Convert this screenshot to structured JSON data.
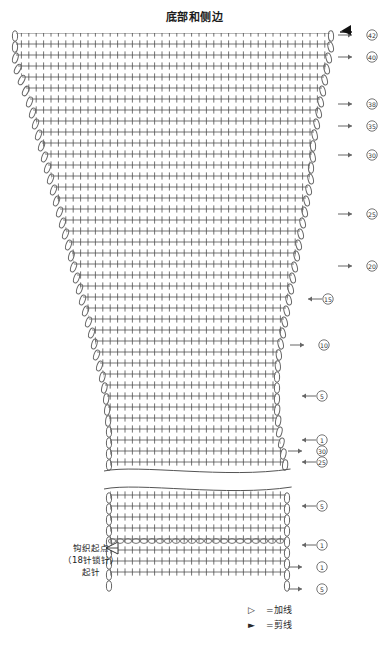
{
  "page": {
    "title": "底部和侧边",
    "background": "#ffffff",
    "stitch_color": "#4a4a4a",
    "marker_color": "#666666",
    "width": 389,
    "height": 661
  },
  "chart_data": {
    "type": "table",
    "title": "底部和侧边",
    "xlabel": "",
    "ylabel": "",
    "stitch_symbol": "+",
    "stitch_name": "短针",
    "edge_symbol": "oval-chain",
    "categories": [],
    "values": [],
    "grid": {
      "rows": 48,
      "top_columns": 46,
      "widest_columns": 46,
      "bottom_columns": 26,
      "row_height": 11,
      "col_width": 7.4,
      "chart_left": 14,
      "chart_right": 330,
      "chart_top": 33,
      "chart_bottom": 592
    },
    "shape_profile": [
      {
        "y": 33,
        "left": 16,
        "right": 330
      },
      {
        "y": 44,
        "left": 16,
        "right": 330
      },
      {
        "y": 55,
        "left": 16,
        "right": 328
      },
      {
        "y": 66,
        "left": 18,
        "right": 326
      },
      {
        "y": 77,
        "left": 22,
        "right": 324
      },
      {
        "y": 88,
        "left": 26,
        "right": 322
      },
      {
        "y": 99,
        "left": 30,
        "right": 320
      },
      {
        "y": 110,
        "left": 33,
        "right": 318
      },
      {
        "y": 121,
        "left": 36,
        "right": 316
      },
      {
        "y": 132,
        "left": 39,
        "right": 314
      },
      {
        "y": 143,
        "left": 42,
        "right": 312
      },
      {
        "y": 154,
        "left": 45,
        "right": 312
      },
      {
        "y": 165,
        "left": 48,
        "right": 310
      },
      {
        "y": 176,
        "left": 51,
        "right": 310
      },
      {
        "y": 187,
        "left": 54,
        "right": 308
      },
      {
        "y": 198,
        "left": 57,
        "right": 306
      },
      {
        "y": 209,
        "left": 60,
        "right": 304
      },
      {
        "y": 220,
        "left": 63,
        "right": 302
      },
      {
        "y": 231,
        "left": 66,
        "right": 300
      },
      {
        "y": 242,
        "left": 69,
        "right": 298
      },
      {
        "y": 253,
        "left": 72,
        "right": 296
      },
      {
        "y": 264,
        "left": 74,
        "right": 294
      },
      {
        "y": 275,
        "left": 77,
        "right": 292
      },
      {
        "y": 286,
        "left": 80,
        "right": 290
      },
      {
        "y": 297,
        "left": 83,
        "right": 288
      },
      {
        "y": 308,
        "left": 86,
        "right": 286
      },
      {
        "y": 319,
        "left": 89,
        "right": 284
      },
      {
        "y": 330,
        "left": 92,
        "right": 282
      },
      {
        "y": 341,
        "left": 95,
        "right": 280
      },
      {
        "y": 352,
        "left": 97,
        "right": 278
      },
      {
        "y": 363,
        "left": 100,
        "right": 277
      },
      {
        "y": 374,
        "left": 103,
        "right": 276
      },
      {
        "y": 385,
        "left": 105,
        "right": 276
      },
      {
        "y": 396,
        "left": 107,
        "right": 276
      },
      {
        "y": 407,
        "left": 108,
        "right": 276
      },
      {
        "y": 418,
        "left": 109,
        "right": 277
      },
      {
        "y": 429,
        "left": 110,
        "right": 278
      },
      {
        "y": 440,
        "left": 110,
        "right": 280
      },
      {
        "y": 451,
        "left": 110,
        "right": 282
      },
      {
        "y": 462,
        "left": 110,
        "right": 284
      },
      {
        "y": 495,
        "left": 110,
        "right": 286
      },
      {
        "y": 506,
        "left": 110,
        "right": 286
      },
      {
        "y": 517,
        "left": 110,
        "right": 286
      },
      {
        "y": 528,
        "left": 110,
        "right": 286
      },
      {
        "y": 545,
        "left": 110,
        "right": 286
      },
      {
        "y": 556,
        "left": 110,
        "right": 286
      },
      {
        "y": 567,
        "left": 110,
        "right": 286
      },
      {
        "y": 578,
        "left": 110,
        "right": 286
      }
    ],
    "break_band": {
      "top": 466,
      "bottom": 492,
      "note": "省略记号（波浪线）"
    }
  },
  "row_markers": [
    {
      "label": "42",
      "y": 35,
      "x": 372,
      "dir": "right",
      "arrow_x": 352
    },
    {
      "label": "40",
      "y": 57,
      "x": 372,
      "dir": "right",
      "arrow_x": 352
    },
    {
      "label": "38",
      "y": 104,
      "x": 372,
      "dir": "right",
      "arrow_x": 352
    },
    {
      "label": "35",
      "y": 126,
      "x": 372,
      "dir": "right",
      "arrow_x": 352
    },
    {
      "label": "30",
      "y": 155,
      "x": 372,
      "dir": "right",
      "arrow_x": 352
    },
    {
      "label": "25",
      "y": 214,
      "x": 372,
      "dir": "right",
      "arrow_x": 352
    },
    {
      "label": "20",
      "y": 266,
      "x": 372,
      "dir": "right",
      "arrow_x": 352
    },
    {
      "label": "15",
      "y": 299,
      "x": 328,
      "dir": "left",
      "arrow_x": 308
    },
    {
      "label": "10",
      "y": 345,
      "x": 324,
      "dir": "right",
      "arrow_x": 304
    },
    {
      "label": "5",
      "y": 396,
      "x": 322,
      "dir": "left",
      "arrow_x": 302
    },
    {
      "label": "1",
      "y": 440,
      "x": 322,
      "dir": "left",
      "arrow_x": 302
    },
    {
      "label": "30",
      "y": 451,
      "x": 322,
      "dir": "right",
      "arrow_x": 302
    },
    {
      "label": "25",
      "y": 462,
      "x": 322,
      "dir": "left",
      "arrow_x": 302
    },
    {
      "label": "5",
      "y": 506,
      "x": 322,
      "dir": "left",
      "arrow_x": 302
    },
    {
      "label": "1",
      "y": 545,
      "x": 322,
      "dir": "left",
      "arrow_x": 302
    },
    {
      "label": "1",
      "y": 567,
      "x": 322,
      "dir": "right",
      "arrow_x": 302
    },
    {
      "label": "5",
      "y": 589,
      "x": 322,
      "dir": "right",
      "arrow_x": 302
    }
  ],
  "annotations": {
    "start_point": {
      "line1": "钩织起点",
      "line2": "（18针锁针）",
      "line3": "起针"
    }
  },
  "legend": {
    "items": [
      {
        "symbol": "▷",
        "symbol_name": "add-yarn-triangle",
        "label": "=加线"
      },
      {
        "symbol": "►",
        "symbol_name": "cut-yarn-triangle",
        "label": "=剪线"
      }
    ]
  },
  "top_marker": {
    "symbol": "►",
    "symbol_name": "cut-yarn-triangle",
    "x": 348,
    "y": 33
  }
}
